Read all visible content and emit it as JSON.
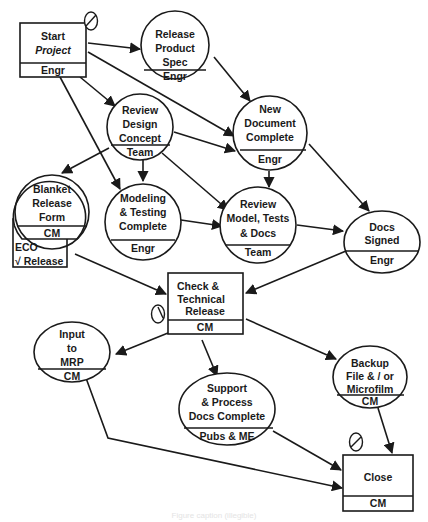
{
  "diagram": {
    "type": "process-flow",
    "nodes": {
      "start": {
        "shape": "box",
        "lines": [
          "Start",
          "Project"
        ],
        "owner": "Engr"
      },
      "release": {
        "shape": "circle",
        "lines": [
          "Release",
          "Product",
          "Spec"
        ],
        "owner": "Engr"
      },
      "review_design": {
        "shape": "circle",
        "lines": [
          "Review",
          "Design",
          "Concept"
        ],
        "owner": "Team"
      },
      "new_doc": {
        "shape": "circle",
        "lines": [
          "New",
          "Document",
          "Complete"
        ],
        "owner": "Engr"
      },
      "blanket": {
        "shape": "circle",
        "lines": [
          "Blanket",
          "Release",
          "Form"
        ],
        "owner": "CM"
      },
      "modeling": {
        "shape": "circle",
        "lines": [
          "Modeling",
          "& Testing",
          "Complete"
        ],
        "owner": "Engr"
      },
      "review_model": {
        "shape": "circle",
        "lines": [
          "Review",
          "Model, Tests",
          "& Docs"
        ],
        "owner": "Team"
      },
      "docs_signed": {
        "shape": "ellipse",
        "lines": [
          "Docs",
          "Signed"
        ],
        "owner": "Engr"
      },
      "check": {
        "shape": "box",
        "lines": [
          "Check &",
          "Technical",
          "Release"
        ],
        "owner": "CM"
      },
      "mrp": {
        "shape": "ellipse",
        "lines": [
          "Input",
          "to",
          "MRP"
        ],
        "owner": "CM"
      },
      "support": {
        "shape": "ellipse",
        "lines": [
          "Support",
          "& Process",
          "Docs Complete"
        ],
        "owner": "Pubs & ME"
      },
      "backup": {
        "shape": "ellipse",
        "lines": [
          "Backup",
          "File & / or",
          "Microfilm"
        ],
        "owner": "CM"
      },
      "close": {
        "shape": "box",
        "lines": [
          "Close"
        ],
        "owner": "CM"
      }
    },
    "eco_note": {
      "line1": "ECO",
      "line2": "√ Release"
    },
    "milestone_icons": [
      "clock-icon at Start Project",
      "clock-icon at Check & Technical Release",
      "clock-icon at Close"
    ],
    "edges": [
      [
        "start",
        "release"
      ],
      [
        "start",
        "review_design"
      ],
      [
        "start",
        "new_doc"
      ],
      [
        "start",
        "modeling"
      ],
      [
        "release",
        "new_doc"
      ],
      [
        "review_design",
        "blanket"
      ],
      [
        "review_design",
        "modeling"
      ],
      [
        "review_design",
        "new_doc"
      ],
      [
        "review_design",
        "review_model"
      ],
      [
        "new_doc",
        "review_model"
      ],
      [
        "new_doc",
        "docs_signed"
      ],
      [
        "modeling",
        "review_model"
      ],
      [
        "review_model",
        "docs_signed"
      ],
      [
        "blanket",
        "check"
      ],
      [
        "docs_signed",
        "check"
      ],
      [
        "check",
        "mrp"
      ],
      [
        "check",
        "support"
      ],
      [
        "check",
        "backup"
      ],
      [
        "mrp",
        "close"
      ],
      [
        "support",
        "close"
      ],
      [
        "backup",
        "close"
      ]
    ],
    "caption": "Figure caption (illegible)"
  }
}
